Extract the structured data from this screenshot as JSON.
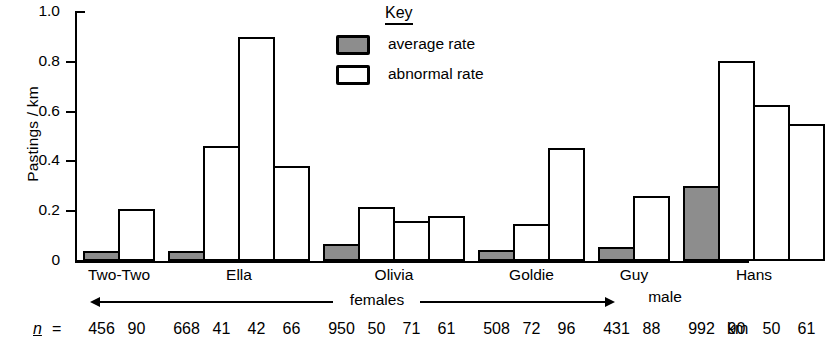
{
  "chart_data": {
    "type": "bar",
    "title": "",
    "xlabel": "",
    "ylabel": "Pastings / km",
    "ylim": [
      0,
      1.0
    ],
    "ytick_labels": [
      "0",
      "0.2",
      "0.4",
      "0.6",
      "0.8",
      "1.0"
    ],
    "ytick_values": [
      0,
      0.2,
      0.4,
      0.6,
      0.8,
      1.0
    ],
    "grid": false,
    "legend": {
      "title": "Key",
      "position": "top-center-right",
      "entries": [
        {
          "label": "average  rate",
          "swatch": "average",
          "color": "#8d8d8d"
        },
        {
          "label": "abnormal  rate",
          "swatch": "abnormal",
          "color": "#ffffff"
        }
      ]
    },
    "categories": [
      "Two-Two",
      "Ella",
      "Olivia",
      "Goldie",
      "Guy",
      "Hans"
    ],
    "group_annotations": [
      {
        "label": "females",
        "covers": [
          "Two-Two",
          "Ella",
          "Olivia",
          "Goldie",
          "Guy"
        ],
        "style": "double-arrow"
      },
      {
        "label": "male",
        "covers": [
          "Hans"
        ],
        "style": "plain"
      }
    ],
    "n_label": "n",
    "n_equals": "=",
    "n_unit": "km",
    "groups": [
      {
        "name": "Two-Two",
        "bars": [
          {
            "series": "average rate",
            "value": 0.04,
            "n": "456"
          },
          {
            "series": "abnormal rate",
            "value": 0.21,
            "n": "90"
          }
        ]
      },
      {
        "name": "Ella",
        "bars": [
          {
            "series": "average rate",
            "value": 0.04,
            "n": "668"
          },
          {
            "series": "abnormal rate",
            "value": 0.46,
            "n": "41"
          },
          {
            "series": "abnormal rate",
            "value": 0.9,
            "n": "42"
          },
          {
            "series": "abnormal rate",
            "value": 0.38,
            "n": "66"
          }
        ]
      },
      {
        "name": "Olivia",
        "bars": [
          {
            "series": "average rate",
            "value": 0.07,
            "n": "950"
          },
          {
            "series": "abnormal rate",
            "value": 0.215,
            "n": "50"
          },
          {
            "series": "abnormal rate",
            "value": 0.16,
            "n": "71"
          },
          {
            "series": "abnormal rate",
            "value": 0.18,
            "n": "61"
          }
        ]
      },
      {
        "name": "Goldie",
        "bars": [
          {
            "series": "average rate",
            "value": 0.045,
            "n": "508"
          },
          {
            "series": "abnormal rate",
            "value": 0.15,
            "n": "72"
          },
          {
            "series": "abnormal rate",
            "value": 0.455,
            "n": "96"
          }
        ]
      },
      {
        "name": "Guy",
        "bars": [
          {
            "series": "average rate",
            "value": 0.055,
            "n": "431"
          },
          {
            "series": "abnormal rate",
            "value": 0.26,
            "n": "88"
          }
        ]
      },
      {
        "name": "Hans",
        "bars": [
          {
            "series": "average rate",
            "value": 0.3,
            "n": "992"
          },
          {
            "series": "abnormal rate",
            "value": 0.805,
            "n": "90"
          },
          {
            "series": "abnormal rate",
            "value": 0.625,
            "n": "50"
          },
          {
            "series": "abnormal rate",
            "value": 0.55,
            "n": "61"
          }
        ]
      }
    ]
  },
  "axis": {
    "y_title": "Pastings / km"
  },
  "legend": {
    "title": "Key",
    "average_label": "average  rate",
    "abnormal_label": "abnormal  rate"
  },
  "footer": {
    "n_symbol": "n",
    "n_equals": "=",
    "unit": "km",
    "females_label": "females",
    "male_label": "male"
  },
  "colors": {
    "average_fill": "#8d8d8d",
    "abnormal_fill": "#ffffff",
    "ink": "#000000"
  }
}
